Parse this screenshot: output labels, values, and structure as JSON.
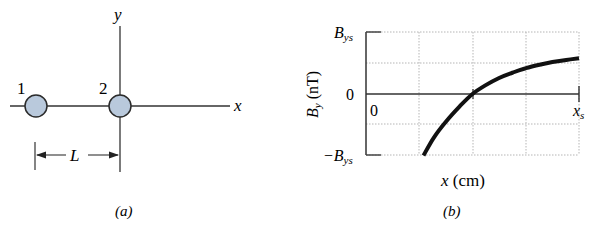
{
  "panel_a": {
    "caption": "(a)",
    "axis_x_label": "x",
    "axis_y_label": "y",
    "particles": [
      {
        "label": "1",
        "cx": 36,
        "cy": 106
      },
      {
        "label": "2",
        "cx": 120,
        "cy": 106
      }
    ],
    "dimension_label": "L",
    "particle_fill": "#b9c9dc",
    "particle_stroke": "#2b2b2b"
  },
  "panel_b": {
    "caption": "(b)",
    "y_axis_label_main": "B",
    "y_axis_label_sub": "y",
    "y_axis_label_unit": " (nT)",
    "y_tick_top_main": "B",
    "y_tick_top_sub": "ys",
    "y_tick_zero": "0",
    "y_tick_bottom_main": "−B",
    "y_tick_bottom_sub": "ys",
    "x_tick_origin": "0",
    "x_tick_end_main": "x",
    "x_tick_end_sub": "s",
    "x_axis_label_var": "x",
    "x_axis_label_unit": " (cm)"
  },
  "chart_data": {
    "type": "line",
    "title": "",
    "xlabel": "x (cm)",
    "ylabel": "B_y (nT)",
    "x_units": "fraction of x_s",
    "y_units": "fraction of B_ys",
    "xlim": [
      0,
      1
    ],
    "ylim": [
      -1,
      1
    ],
    "grid": true,
    "grid_x_divisions": 4,
    "grid_y_divisions": 4,
    "x_ticks": [
      "0",
      "x_s"
    ],
    "y_ticks": [
      "-B_ys",
      "0",
      "B_ys"
    ],
    "series": [
      {
        "name": "B_y",
        "x": [
          0.27,
          0.32,
          0.375,
          0.44,
          0.5,
          0.56,
          0.625,
          0.69,
          0.75,
          0.82,
          0.875,
          0.94,
          1.0
        ],
        "y": [
          -1.0,
          -0.7,
          -0.45,
          -0.2,
          0.0,
          0.14,
          0.26,
          0.35,
          0.42,
          0.48,
          0.52,
          0.555,
          0.58
        ]
      }
    ]
  }
}
